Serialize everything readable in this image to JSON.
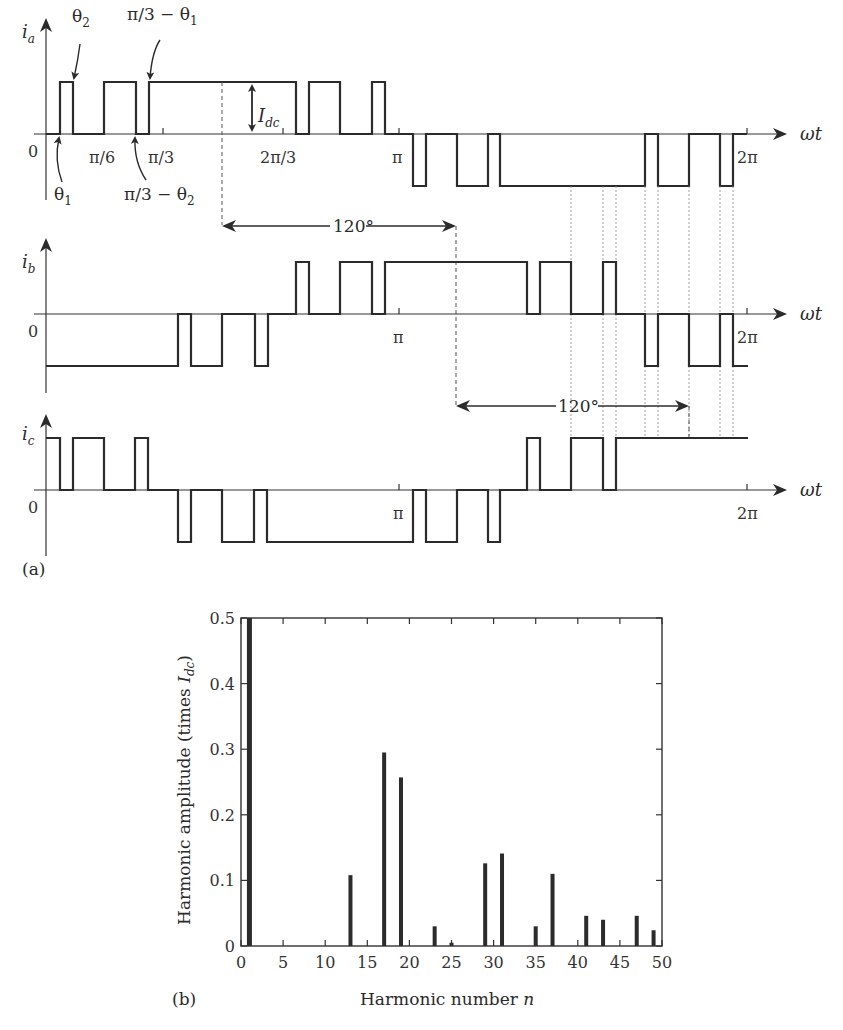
{
  "figure": {
    "panel_a_label": "(a)",
    "panel_b_label": "(b)"
  },
  "waveforms": {
    "x_axis_label": "ωt",
    "zero_label": "0",
    "dc_label": "I",
    "dc_sub": "dc",
    "phase_shift_label": "120°",
    "ia": {
      "label": "i",
      "sub": "a",
      "ticks": [
        "π/6",
        "π/3",
        "2π/3",
        "π",
        "2π"
      ],
      "annotations": {
        "theta1": "θ",
        "theta1_sub": "1",
        "theta2": "θ",
        "theta2_sub": "2",
        "pi3_minus_theta1": "π/3 − θ",
        "pi3_minus_theta1_sub": "1",
        "pi3_minus_theta2": "π/3 − θ",
        "pi3_minus_theta2_sub": "2"
      }
    },
    "ib": {
      "label": "i",
      "sub": "b",
      "ticks": [
        "π",
        "2π"
      ]
    },
    "ic": {
      "label": "i",
      "sub": "c",
      "ticks": [
        "π",
        "2π"
      ]
    }
  },
  "chart_data": [
    {
      "type": "line",
      "title": "Three-phase PWM current waveforms i_a, i_b, i_c (120° displaced)",
      "xlabel": "ωt",
      "ylabel": "i (levels: +I_dc, 0, −I_dc)",
      "x_ticks": [
        "0",
        "π/6",
        "π/3",
        "2π/3",
        "π",
        "2π"
      ],
      "series": [
        {
          "name": "i_a",
          "description": "Pulse pattern with switching angles θ1, θ2, π/3−θ2, π/3−θ1 in each 60° segment; positive half-cycle 0..π, negative mirror π..2π",
          "levels_sequence_first_half": [
            0,
            1,
            0,
            1,
            0,
            1,
            0,
            1,
            0,
            1,
            0
          ],
          "levels_sequence_second_half": [
            0,
            -1,
            0,
            -1,
            0,
            -1,
            0,
            -1,
            0,
            -1,
            0
          ]
        },
        {
          "name": "i_b",
          "description": "i_a shifted by 120°"
        },
        {
          "name": "i_c",
          "description": "i_a shifted by 240°"
        }
      ],
      "annotations": [
        "θ1",
        "θ2",
        "π/3 − θ1",
        "π/3 − θ2",
        "I_dc",
        "120°",
        "120°"
      ]
    },
    {
      "type": "bar",
      "title": "",
      "xlabel": "Harmonic number n",
      "ylabel": "Harmonic amplitude (times I_dc)",
      "xlim": [
        0,
        50
      ],
      "ylim": [
        0,
        0.5
      ],
      "x_ticks": [
        0,
        5,
        10,
        15,
        20,
        25,
        30,
        35,
        40,
        45,
        50
      ],
      "y_ticks": [
        0,
        0.1,
        0.2,
        0.3,
        0.4,
        0.5
      ],
      "y_tick_labels": [
        "0",
        "0.1",
        "0.2",
        "0.3",
        "0.4",
        "0.5"
      ],
      "categories": [
        1,
        13,
        17,
        19,
        23,
        25,
        29,
        31,
        35,
        37,
        41,
        43,
        47,
        49
      ],
      "values": [
        0.5,
        0.108,
        0.295,
        0.257,
        0.03,
        0.005,
        0.126,
        0.141,
        0.03,
        0.11,
        0.046,
        0.04,
        0.046,
        0.024
      ],
      "grid": false,
      "legend": null
    }
  ],
  "bar_chart": {
    "ylabel": "Harmonic amplitude (times ",
    "ylabel_I": "I",
    "ylabel_sub": "dc",
    "ylabel_close": ")",
    "xlabel": "Harmonic number ",
    "xlabel_n": "n"
  }
}
